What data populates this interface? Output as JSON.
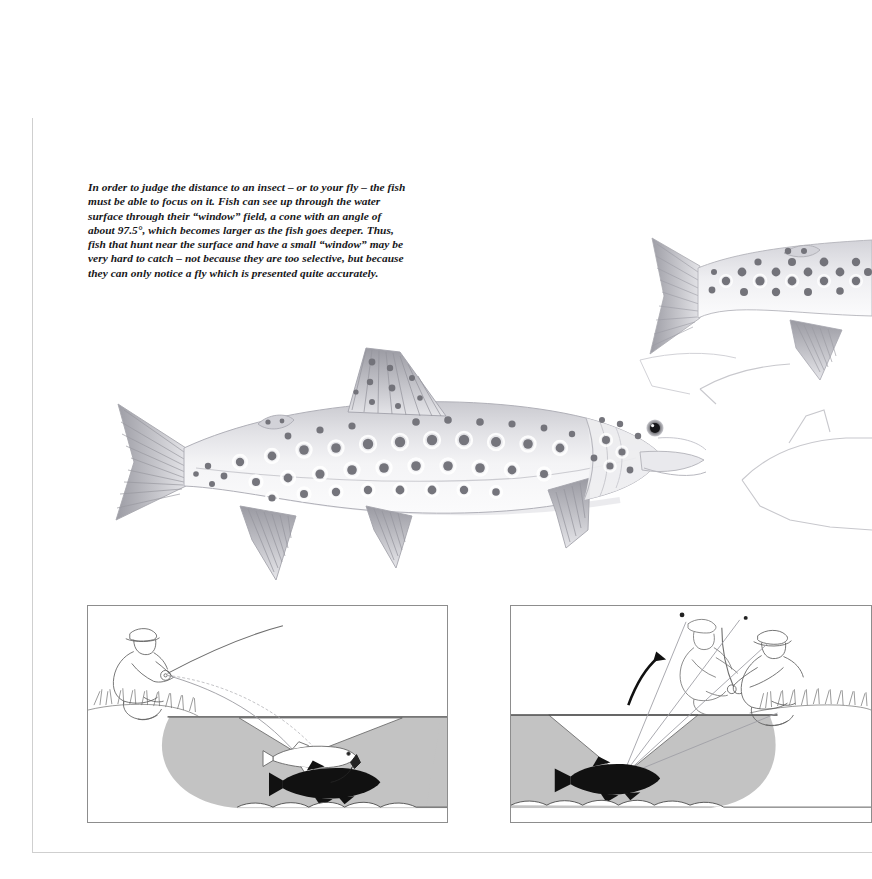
{
  "page": {
    "background_color": "#ffffff",
    "edge_line_color": "#cfcfcf"
  },
  "caption": {
    "text": "In order to judge the distance to an insect – or to your fly – the fish must be able to focus on it. Fish can see up through the water surface through their “window” field, a cone with an angle of about 97.5°, which becomes larger as the fish goes deeper. Thus, fish that hunt near the surface and have a small “window” may be very hard to catch – not because they are too selective, but because they can only notice a fly which is presented quite accurately.",
    "style": "bold-italic-serif",
    "angle_value": "97.5°"
  },
  "illustration": {
    "subject": "brown trout",
    "style": "greyscale pencil / watercolour rendering",
    "main_fish": {
      "name": "spotted-trout-main",
      "orientation": "facing right",
      "spot_color": "#7c7c82",
      "body_color": "#e9e9ec",
      "fin_color": "#b9b9bf",
      "eye_color": "#1a1a1a"
    },
    "second_fish": {
      "name": "spotted-trout-upper-right",
      "orientation": "facing right, partially cropped at page edge"
    },
    "ghost_fish": {
      "name": "trout-outline-sketch",
      "description": "faint pencil outline of a third fish at right edge"
    }
  },
  "panels": [
    {
      "id": "panel-left",
      "name": "shallow-fish-window-diagram",
      "caption_role": "fish near surface – small window",
      "elements": {
        "angler": "kneeling fly-fisher on bank with rod and line",
        "bank_grass": true,
        "water_surface_line": true,
        "window_cone": "small light cone from fish to surface",
        "fish_silhouette": "black trout below surface",
        "mirror_fish": "outline trout reflected on underside of surface",
        "fly": "small artificial fly on the surface",
        "streambed": "pebble bottom line"
      },
      "colors": {
        "water_fill": "#c3c3c3",
        "window_fill": "#ffffff",
        "line": "#6e6e6e",
        "fish": "#111111"
      }
    },
    {
      "id": "panel-right",
      "name": "deep-fish-window-diagram",
      "caption_role": "fish deeper – large window",
      "elements": {
        "angler": "kneeling fly-fisher on bank with rod and line",
        "refracted_angler": "distorted mirror image of angler seen through window",
        "curved_arrow": "arrow indicating refraction direction",
        "bank_grass": true,
        "water_surface_line": true,
        "window_cone": "large light cone from fish to surface",
        "fish_silhouette": "black trout deep below surface",
        "streambed": "pebble bottom line"
      },
      "colors": {
        "water_fill": "#c3c3c3",
        "window_fill": "#ffffff",
        "line": "#6e6e6e",
        "fish": "#111111"
      }
    }
  ]
}
